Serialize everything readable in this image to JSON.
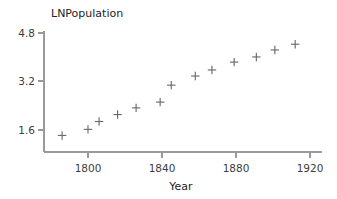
{
  "chart_data": {
    "type": "scatter",
    "title": "LNPopulation",
    "xlabel": "Year",
    "ylabel": "",
    "xlim": [
      1778,
      1920
    ],
    "ylim": [
      1.05,
      4.95
    ],
    "xticks": [
      "1800",
      "1840",
      "1880",
      "1920"
    ],
    "xtick_values": [
      1800,
      1840,
      1880,
      1920
    ],
    "yticks": [
      "1.6",
      "3.2",
      "4.8"
    ],
    "ytick_values": [
      1.6,
      3.2,
      4.8
    ],
    "grid": false,
    "legend": "none",
    "marker": "plus",
    "marker_color": "#6b6b6b",
    "axis_color": "#9a9a9a",
    "x": [
      1786,
      1800,
      1806,
      1816,
      1826,
      1839,
      1845,
      1858,
      1867,
      1879,
      1891,
      1901,
      1912
    ],
    "values": [
      1.42,
      1.62,
      1.88,
      2.11,
      2.33,
      2.52,
      3.08,
      3.38,
      3.58,
      3.84,
      4.01,
      4.24,
      4.43
    ],
    "series": [
      {
        "name": "LNPopulation",
        "points": [
          {
            "x": 1786,
            "y": 1.42
          },
          {
            "x": 1800,
            "y": 1.62
          },
          {
            "x": 1806,
            "y": 1.88
          },
          {
            "x": 1816,
            "y": 2.11
          },
          {
            "x": 1826,
            "y": 2.33
          },
          {
            "x": 1839,
            "y": 2.52
          },
          {
            "x": 1845,
            "y": 3.08
          },
          {
            "x": 1858,
            "y": 3.38
          },
          {
            "x": 1867,
            "y": 3.58
          },
          {
            "x": 1879,
            "y": 3.84
          },
          {
            "x": 1891,
            "y": 4.01
          },
          {
            "x": 1901,
            "y": 4.24
          },
          {
            "x": 1912,
            "y": 4.43
          }
        ]
      }
    ]
  },
  "labels": {
    "title": "LNPopulation",
    "xlabel": "Year",
    "ytick_0": "1.6",
    "ytick_1": "3.2",
    "ytick_2": "4.8",
    "xtick_0": "1800",
    "xtick_1": "1840",
    "xtick_2": "1880",
    "xtick_3": "1920"
  }
}
